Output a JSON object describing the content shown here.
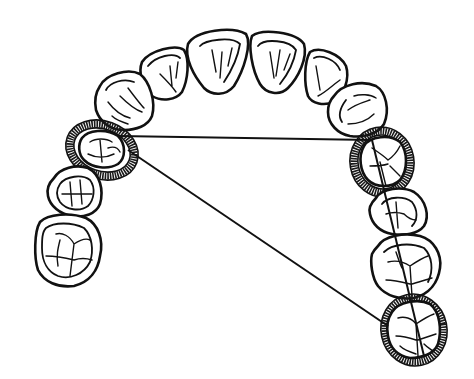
{
  "figure": {
    "type": "dental-arch-occlusal-diagram",
    "description": "Occlusal view of a dental arch with incisors, canines, premolars and molars; three teeth are circled with stippled rings and connected by straight measurement lines.",
    "colors": {
      "background": "#ffffff",
      "line": "#111111",
      "ring": "#1a1a1a"
    },
    "teeth": [
      {
        "id": "central-incisor-left",
        "group": "anterior"
      },
      {
        "id": "central-incisor-right",
        "group": "anterior"
      },
      {
        "id": "lateral-incisor-left",
        "group": "anterior"
      },
      {
        "id": "lateral-incisor-right",
        "group": "anterior"
      },
      {
        "id": "canine-left",
        "group": "anterior"
      },
      {
        "id": "canine-right",
        "group": "anterior"
      },
      {
        "id": "premolar-left-1",
        "group": "posterior-left",
        "circled": true
      },
      {
        "id": "premolar-left-2",
        "group": "posterior-left"
      },
      {
        "id": "molar-left-1",
        "group": "posterior-left"
      },
      {
        "id": "premolar-right-1",
        "group": "posterior-right",
        "circled": true
      },
      {
        "id": "premolar-right-2",
        "group": "posterior-right"
      },
      {
        "id": "molar-right-1",
        "group": "posterior-right"
      },
      {
        "id": "molar-right-2",
        "group": "posterior-right",
        "circled": true
      }
    ],
    "measurement_lines": [
      {
        "id": "transverse-line",
        "from": "premolar-left-1",
        "to": "premolar-right-1"
      },
      {
        "id": "diagonal-line",
        "from": "premolar-left-1",
        "to": "molar-right-2"
      },
      {
        "id": "sagittal-line",
        "from": "premolar-right-1",
        "to": "molar-right-2"
      }
    ]
  }
}
